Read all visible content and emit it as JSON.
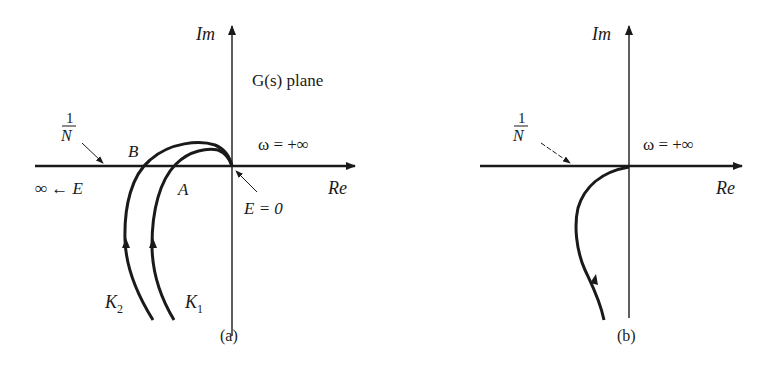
{
  "panel_a": {
    "caption": "(a)",
    "axis_im": "Im",
    "axis_re": "Re",
    "plane_label": "G(s) plane",
    "omega_label": "ω = +∞",
    "one_over_n_num": "1",
    "one_over_n_den": "N",
    "point_b": "B",
    "point_a": "A",
    "inf_e": "∞ ← E",
    "e_zero": "E = 0",
    "k2_base": "K",
    "k2_sub": "2",
    "k1_base": "K",
    "k1_sub": "1"
  },
  "panel_b": {
    "caption": "(b)",
    "axis_im": "Im",
    "axis_re": "Re",
    "omega_label": "ω = +∞",
    "one_over_n_num": "1",
    "one_over_n_den": "N"
  },
  "colors": {
    "ink": "#1a1a1a",
    "background": "#ffffff"
  }
}
